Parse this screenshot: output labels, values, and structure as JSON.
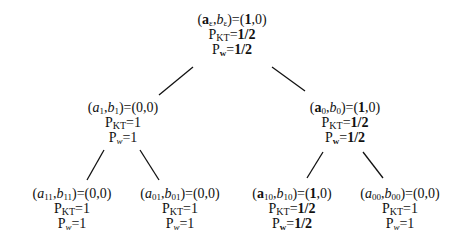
{
  "tree": {
    "root": {
      "a_sub": "ε",
      "b_sub": "ε",
      "a_bold": true,
      "value_a": "1",
      "value_b": "0",
      "pkt": "1/2",
      "pw": "1/2",
      "bold_probs": true
    },
    "n1": {
      "a_sub": "1",
      "b_sub": "1",
      "a_bold": false,
      "value_a": "0",
      "value_b": "0",
      "pkt": "1",
      "pw": "1",
      "bold_probs": false
    },
    "n0": {
      "a_sub": "0",
      "b_sub": "0",
      "a_bold": true,
      "value_a": "1",
      "value_b": "0",
      "pkt": "1/2",
      "pw": "1/2",
      "bold_probs": true
    },
    "n11": {
      "a_sub": "11",
      "b_sub": "11",
      "a_bold": false,
      "value_a": "0",
      "value_b": "0",
      "pkt": "1",
      "pw": "1",
      "bold_probs": false
    },
    "n01": {
      "a_sub": "01",
      "b_sub": "01",
      "a_bold": false,
      "value_a": "0",
      "value_b": "0",
      "pkt": "1",
      "pw": "1",
      "bold_probs": false
    },
    "n10": {
      "a_sub": "10",
      "b_sub": "10",
      "a_bold": true,
      "value_a": "1",
      "value_b": "0",
      "pkt": "1/2",
      "pw": "1/2",
      "bold_probs": true
    },
    "n00": {
      "a_sub": "00",
      "b_sub": "00",
      "a_bold": false,
      "value_a": "0",
      "value_b": "0",
      "pkt": "1",
      "pw": "1",
      "bold_probs": false
    }
  },
  "labels": {
    "P": "P",
    "KT": "KT",
    "w": "w",
    "a": "a",
    "b": "b",
    "eq": "=",
    "open": "(",
    "close": ")",
    "comma": ","
  },
  "edges": [
    {
      "from": "root",
      "to": "n1",
      "x1": 193,
      "y1": 67,
      "x2": 159,
      "y2": 95
    },
    {
      "from": "root",
      "to": "n0",
      "x1": 272,
      "y1": 67,
      "x2": 305,
      "y2": 91
    },
    {
      "from": "n1",
      "to": "n11",
      "x1": 104,
      "y1": 150,
      "x2": 87,
      "y2": 180
    },
    {
      "from": "n1",
      "to": "n01",
      "x1": 140,
      "y1": 150,
      "x2": 159,
      "y2": 180
    },
    {
      "from": "n0",
      "to": "n10",
      "x1": 323,
      "y1": 152,
      "x2": 307,
      "y2": 178
    },
    {
      "from": "n0",
      "to": "n00",
      "x1": 363,
      "y1": 152,
      "x2": 383,
      "y2": 178
    }
  ]
}
